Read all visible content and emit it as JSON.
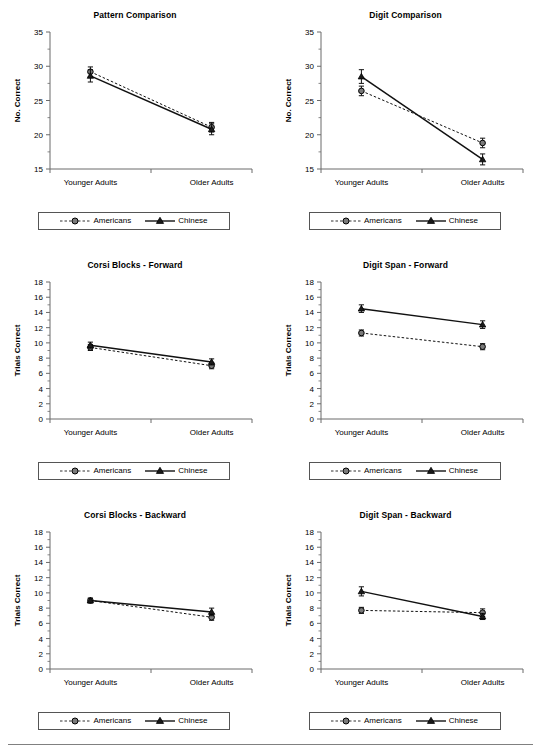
{
  "figure": {
    "name": "six-panel-line-chart-figure",
    "series_names": [
      "Americans",
      "Chinese"
    ],
    "categories": [
      "Younger Adults",
      "Older Adults"
    ],
    "legend": {
      "americans_label": "Americans",
      "chinese_label": "Chinese",
      "americans_marker": "circle-marker-dashed-line",
      "chinese_marker": "triangle-marker-solid-line"
    },
    "colors": {
      "line": "#000000",
      "axis": "#6b6b6b",
      "legend_border": "#555555",
      "footer_rule": "#808080",
      "marker_fill_americans": "#808080",
      "marker_fill_chinese": "#1a1a1a"
    }
  },
  "chart_data": [
    {
      "type": "line",
      "title": "Pattern Comparison",
      "xlabel": "",
      "ylabel": "No. Correct",
      "categories": [
        "Younger Adults",
        "Older Adults"
      ],
      "ylim": [
        15,
        35
      ],
      "yticks": [
        15,
        20,
        25,
        30,
        35
      ],
      "ytick_labels": [
        "15",
        "20",
        "25",
        "30",
        "35"
      ],
      "minor_ticks": true,
      "grid": false,
      "legend_position": "below-axis",
      "series": [
        {
          "name": "Americans",
          "values": [
            29.2,
            21.1
          ],
          "errors": [
            0.7,
            0.7
          ],
          "style": "dashed",
          "marker": "circle"
        },
        {
          "name": "Chinese",
          "values": [
            28.6,
            20.8
          ],
          "errors": [
            0.9,
            0.8
          ],
          "style": "solid",
          "marker": "triangle"
        }
      ]
    },
    {
      "type": "line",
      "title": "Digit Comparison",
      "xlabel": "",
      "ylabel": "No. Correct",
      "categories": [
        "Younger Adults",
        "Older Adults"
      ],
      "ylim": [
        15,
        35
      ],
      "yticks": [
        15,
        20,
        25,
        30,
        35
      ],
      "ytick_labels": [
        "15",
        "20",
        "25",
        "30",
        "35"
      ],
      "minor_ticks": true,
      "grid": false,
      "legend_position": "below-axis",
      "series": [
        {
          "name": "Americans",
          "values": [
            26.4,
            18.8
          ],
          "errors": [
            0.7,
            0.7
          ],
          "style": "dashed",
          "marker": "circle"
        },
        {
          "name": "Chinese",
          "values": [
            28.5,
            16.4
          ],
          "errors": [
            1.0,
            0.8
          ],
          "style": "solid",
          "marker": "triangle"
        }
      ]
    },
    {
      "type": "line",
      "title": "Corsi Blocks - Forward",
      "xlabel": "",
      "ylabel": "Trials Correct",
      "categories": [
        "Younger Adults",
        "Older Adults"
      ],
      "ylim": [
        0,
        18
      ],
      "yticks": [
        0,
        2,
        4,
        6,
        8,
        10,
        12,
        14,
        16,
        18
      ],
      "ytick_labels": [
        "0",
        "2",
        "4",
        "6",
        "8",
        "10",
        "12",
        "14",
        "16",
        "18"
      ],
      "minor_ticks": true,
      "grid": false,
      "legend_position": "below-axis",
      "series": [
        {
          "name": "Americans",
          "values": [
            9.4,
            7.0
          ],
          "errors": [
            0.4,
            0.4
          ],
          "style": "dashed",
          "marker": "circle"
        },
        {
          "name": "Chinese",
          "values": [
            9.7,
            7.5
          ],
          "errors": [
            0.4,
            0.4
          ],
          "style": "solid",
          "marker": "triangle"
        }
      ]
    },
    {
      "type": "line",
      "title": "Digit Span - Forward",
      "xlabel": "",
      "ylabel": "Trials Correct",
      "categories": [
        "Younger Adults",
        "Older Adults"
      ],
      "ylim": [
        0,
        18
      ],
      "yticks": [
        0,
        2,
        4,
        6,
        8,
        10,
        12,
        14,
        16,
        18
      ],
      "ytick_labels": [
        "0",
        "2",
        "4",
        "6",
        "8",
        "10",
        "12",
        "14",
        "16",
        "18"
      ],
      "minor_ticks": true,
      "grid": false,
      "legend_position": "below-axis",
      "series": [
        {
          "name": "Americans",
          "values": [
            11.3,
            9.5
          ],
          "errors": [
            0.4,
            0.4
          ],
          "style": "dashed",
          "marker": "circle"
        },
        {
          "name": "Chinese",
          "values": [
            14.5,
            12.4
          ],
          "errors": [
            0.5,
            0.5
          ],
          "style": "solid",
          "marker": "triangle"
        }
      ]
    },
    {
      "type": "line",
      "title": "Corsi Blocks - Backward",
      "xlabel": "",
      "ylabel": "Trials Correct",
      "categories": [
        "Younger Adults",
        "Older Adults"
      ],
      "ylim": [
        0,
        18
      ],
      "yticks": [
        0,
        2,
        4,
        6,
        8,
        10,
        12,
        14,
        16,
        18
      ],
      "ytick_labels": [
        "0",
        "2",
        "4",
        "6",
        "8",
        "10",
        "12",
        "14",
        "16",
        "18"
      ],
      "minor_ticks": true,
      "grid": false,
      "legend_position": "below-axis",
      "series": [
        {
          "name": "Americans",
          "values": [
            9.0,
            6.8
          ],
          "errors": [
            0.3,
            0.4
          ],
          "style": "dashed",
          "marker": "circle"
        },
        {
          "name": "Chinese",
          "values": [
            9.0,
            7.5
          ],
          "errors": [
            0.3,
            0.5
          ],
          "style": "solid",
          "marker": "triangle"
        }
      ]
    },
    {
      "type": "line",
      "title": "Digit Span - Backward",
      "xlabel": "",
      "ylabel": "Trials Correct",
      "categories": [
        "Younger Adults",
        "Older Adults"
      ],
      "ylim": [
        0,
        18
      ],
      "yticks": [
        0,
        2,
        4,
        6,
        8,
        10,
        12,
        14,
        16,
        18
      ],
      "ytick_labels": [
        "0",
        "2",
        "4",
        "6",
        "8",
        "10",
        "12",
        "14",
        "16",
        "18"
      ],
      "minor_ticks": true,
      "grid": false,
      "legend_position": "below-axis",
      "series": [
        {
          "name": "Americans",
          "values": [
            7.7,
            7.4
          ],
          "errors": [
            0.4,
            0.5
          ],
          "style": "dashed",
          "marker": "circle"
        },
        {
          "name": "Chinese",
          "values": [
            10.2,
            6.9
          ],
          "errors": [
            0.6,
            0.4
          ],
          "style": "solid",
          "marker": "triangle"
        }
      ]
    }
  ]
}
